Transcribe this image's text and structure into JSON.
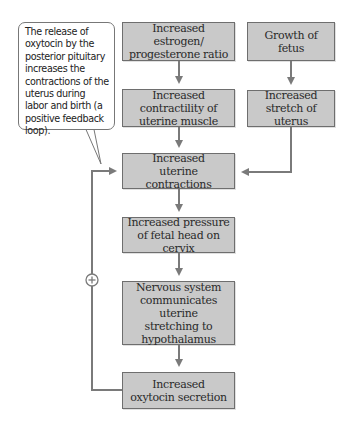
{
  "diagram": {
    "callout": {
      "text": "The release of oxytocin by the posterior pituitary increases the contractions of the uterus during labor and birth (a positive feedback loop)."
    },
    "nodes": [
      {
        "id": "estrogen",
        "label": "Increased estrogen/ progesterone ratio"
      },
      {
        "id": "fetus",
        "label": "Growth of fetus"
      },
      {
        "id": "contractility",
        "label": "Increased contractility of uterine muscle"
      },
      {
        "id": "stretch",
        "label": "Increased stretch of uterus"
      },
      {
        "id": "contractions",
        "label": "Increased uterine contractions"
      },
      {
        "id": "pressure",
        "label": "Increased pressure of fetal head on cervix"
      },
      {
        "id": "nervous",
        "label": "Nervous system communicates uterine stretching to hypothalamus"
      },
      {
        "id": "oxytocin",
        "label": "Increased oxytocin secretion"
      }
    ],
    "edges": [
      {
        "from": "estrogen",
        "to": "contractility"
      },
      {
        "from": "fetus",
        "to": "stretch"
      },
      {
        "from": "contractility",
        "to": "contractions"
      },
      {
        "from": "stretch",
        "to": "contractions"
      },
      {
        "from": "contractions",
        "to": "pressure"
      },
      {
        "from": "pressure",
        "to": "nervous"
      },
      {
        "from": "nervous",
        "to": "oxytocin"
      },
      {
        "from": "oxytocin",
        "to": "contractions",
        "sign": "+"
      }
    ],
    "feedback_symbol": "+",
    "colors": {
      "box_fill": "#c9c9c9",
      "box_border": "#6e6e6e",
      "arrow": "#7a7a7a"
    }
  }
}
